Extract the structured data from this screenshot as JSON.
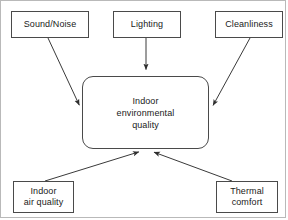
{
  "diagram": {
    "type": "concept-map",
    "colors": {
      "node_border": "#4a4a4a",
      "node_fill": "#ffffff",
      "edge": "#3a3a3a",
      "text": "#1a1a1a",
      "frame": "#b9b9b9",
      "background": "#ffffff"
    },
    "center_node": {
      "id": "ieq",
      "label": "Indoor\nenvironmental\nquality",
      "shape": "rounded-rectangle",
      "x": 82,
      "y": 76,
      "width": 127,
      "height": 73
    },
    "nodes": [
      {
        "id": "sound-noise",
        "label": "Sound/Noise",
        "shape": "rectangle",
        "x": 11,
        "y": 11,
        "width": 78,
        "height": 27
      },
      {
        "id": "lighting",
        "label": "Lighting",
        "shape": "rectangle",
        "x": 113,
        "y": 11,
        "width": 68,
        "height": 27
      },
      {
        "id": "cleanliness",
        "label": "Cleanliness",
        "shape": "rectangle",
        "x": 215,
        "y": 11,
        "width": 68,
        "height": 27
      },
      {
        "id": "indoor-air-quality",
        "label": "Indoor\nair quality",
        "shape": "rectangle",
        "x": 13,
        "y": 181,
        "width": 61,
        "height": 32
      },
      {
        "id": "thermal-comfort",
        "label": "Thermal\ncomfort",
        "shape": "rectangle",
        "x": 216,
        "y": 181,
        "width": 62,
        "height": 32
      }
    ],
    "edges": [
      {
        "id": "edge-sound-noise-to-ieq",
        "from": "sound-noise",
        "to": "ieq",
        "arrowhead": "target",
        "x1": 48,
        "y1": 38,
        "x2": 82,
        "y2": 111
      },
      {
        "id": "edge-lighting-to-ieq",
        "from": "lighting",
        "to": "ieq",
        "arrowhead": "target",
        "x1": 146,
        "y1": 38,
        "x2": 146,
        "y2": 76
      },
      {
        "id": "edge-cleanliness-to-ieq",
        "from": "cleanliness",
        "to": "ieq",
        "arrowhead": "target",
        "x1": 250,
        "y1": 38,
        "x2": 210,
        "y2": 111
      },
      {
        "id": "edge-indoor-air-quality-to-ieq",
        "from": "indoor-air-quality",
        "to": "ieq",
        "arrowhead": "target",
        "x1": 45,
        "y1": 181,
        "x2": 145,
        "y2": 150
      },
      {
        "id": "edge-thermal-comfort-to-ieq",
        "from": "thermal-comfort",
        "to": "ieq",
        "arrowhead": "target",
        "x1": 232,
        "y1": 181,
        "x2": 148,
        "y2": 150
      }
    ]
  }
}
